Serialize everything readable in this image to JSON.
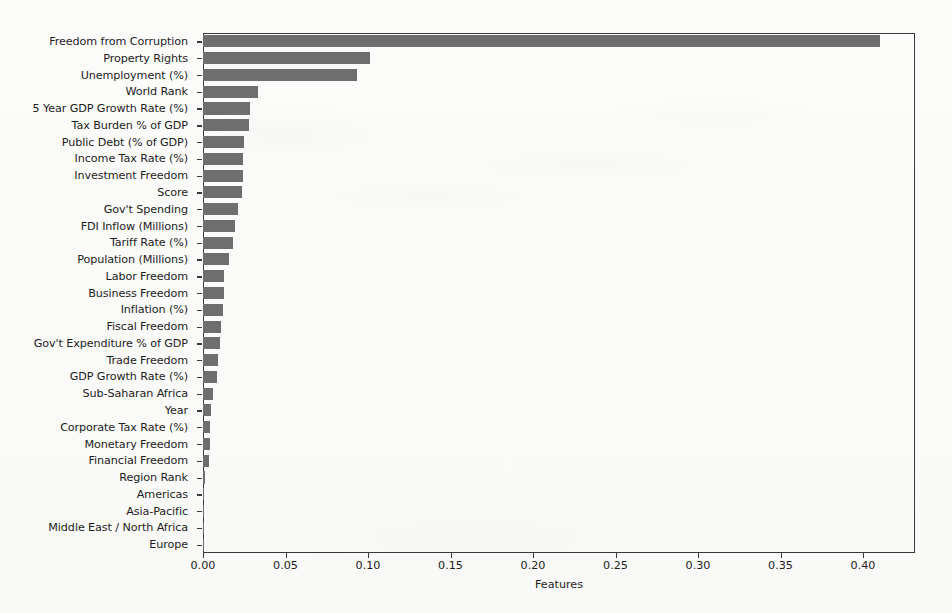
{
  "chart_data": {
    "type": "bar",
    "orientation": "horizontal",
    "title": "",
    "xlabel": "Features",
    "ylabel": "",
    "xlim": [
      0.0,
      0.4315
    ],
    "grid": false,
    "legend": null,
    "bar_color": "#6e6e6e",
    "axis_color": "#3a3a3a",
    "background_color": "#fbfbfa",
    "xticks": [
      0.0,
      0.05,
      0.1,
      0.15,
      0.2,
      0.25,
      0.3,
      0.35,
      0.4
    ],
    "xticklabels": [
      "0.00",
      "0.05",
      "0.10",
      "0.15",
      "0.20",
      "0.25",
      "0.30",
      "0.35",
      "0.40"
    ],
    "categories": [
      "Freedom from Corruption",
      "Property Rights",
      "Unemployment (%)",
      "World Rank",
      "5 Year GDP Growth Rate (%)",
      "Tax Burden % of GDP",
      "Public Debt (% of GDP)",
      "Income Tax Rate (%)",
      "Investment Freedom",
      "Score",
      "Gov't Spending",
      "FDI Inflow (Millions)",
      "Tariff Rate (%)",
      "Population (Millions)",
      "Labor Freedom",
      "Business Freedom",
      "Inflation (%)",
      "Fiscal Freedom",
      "Gov't Expenditure % of GDP",
      "Trade Freedom",
      "GDP Growth Rate (%)",
      "Sub-Saharan Africa",
      "Year",
      "Corporate Tax Rate (%)",
      "Monetary Freedom",
      "Financial Freedom",
      "Region Rank",
      "Americas",
      "Asia-Pacific",
      "Middle East / North Africa",
      "Europe"
    ],
    "values": [
      0.4105,
      0.1015,
      0.0935,
      0.0335,
      0.0285,
      0.028,
      0.025,
      0.0245,
      0.024,
      0.0235,
      0.0215,
      0.0195,
      0.018,
      0.016,
      0.013,
      0.0125,
      0.012,
      0.011,
      0.0105,
      0.009,
      0.0085,
      0.006,
      0.005,
      0.0045,
      0.004,
      0.0035,
      0.0015,
      0.0002,
      0.0002,
      0.0002,
      0.0002
    ]
  }
}
